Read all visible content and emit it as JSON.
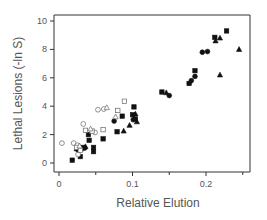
{
  "chart_data": {
    "type": "scatter",
    "title": "",
    "xlabel": "Relative Elution",
    "ylabel": "Lethal Lesions (-ln S)",
    "xlim": [
      -0.007,
      0.26
    ],
    "ylim": [
      -0.5,
      10.5
    ],
    "x_ticks": [
      0,
      0.1,
      0.2
    ],
    "x_tick_labels": [
      "0",
      "0.1",
      "0.2"
    ],
    "x_minor_ticks": [
      0.05,
      0.15,
      0.25
    ],
    "y_ticks": [
      0,
      2,
      4,
      6,
      8,
      10
    ],
    "y_tick_labels": [
      "0",
      "2",
      "4",
      "6",
      "8",
      "10"
    ],
    "grid": false,
    "legend": "none",
    "series": [
      {
        "name": "filled-square",
        "marker": "square",
        "filled": true,
        "points": [
          [
            0.018,
            0.2
          ],
          [
            0.029,
            0.45
          ],
          [
            0.03,
            1.0
          ],
          [
            0.033,
            1.1
          ],
          [
            0.04,
            2.0
          ],
          [
            0.041,
            1.6
          ],
          [
            0.047,
            1.1
          ],
          [
            0.047,
            0.8
          ],
          [
            0.06,
            1.7
          ],
          [
            0.079,
            2.2
          ],
          [
            0.086,
            3.3
          ],
          [
            0.102,
            3.95
          ],
          [
            0.1,
            3.4
          ],
          [
            0.14,
            5.0
          ],
          [
            0.177,
            5.6
          ],
          [
            0.185,
            6.5
          ],
          [
            0.212,
            8.85
          ],
          [
            0.228,
            9.3
          ],
          [
            0.104,
            3.1
          ]
        ]
      },
      {
        "name": "filled-circle",
        "marker": "circle",
        "filled": true,
        "points": [
          [
            0.026,
            0.9
          ],
          [
            0.035,
            1.05
          ],
          [
            0.075,
            2.95
          ],
          [
            0.101,
            3.05
          ],
          [
            0.15,
            4.75
          ],
          [
            0.18,
            5.8
          ],
          [
            0.185,
            6.1
          ],
          [
            0.195,
            7.8
          ],
          [
            0.202,
            7.85
          ]
        ]
      },
      {
        "name": "filled-triangle",
        "marker": "triangle",
        "filled": true,
        "points": [
          [
            0.024,
            1.0
          ],
          [
            0.036,
            1.15
          ],
          [
            0.088,
            2.25
          ],
          [
            0.096,
            2.65
          ],
          [
            0.104,
            3.45
          ],
          [
            0.106,
            2.9
          ],
          [
            0.146,
            4.95
          ],
          [
            0.213,
            8.6
          ],
          [
            0.219,
            8.8
          ],
          [
            0.219,
            6.2
          ],
          [
            0.245,
            8.0
          ]
        ]
      },
      {
        "name": "open-circle",
        "marker": "circle",
        "filled": false,
        "points": [
          [
            0.004,
            1.4
          ],
          [
            0.02,
            1.4
          ],
          [
            0.033,
            2.75
          ],
          [
            0.025,
            1.25
          ],
          [
            0.049,
            2.15
          ],
          [
            0.053,
            3.75
          ],
          [
            0.061,
            3.8
          ],
          [
            0.026,
            0.6
          ]
        ]
      },
      {
        "name": "open-square",
        "marker": "square",
        "filled": false,
        "points": [
          [
            0.024,
            1.1
          ],
          [
            0.036,
            2.3
          ],
          [
            0.06,
            2.35
          ],
          [
            0.08,
            3.7
          ],
          [
            0.089,
            4.35
          ],
          [
            0.029,
            0.9
          ],
          [
            0.045,
            2.25
          ]
        ]
      },
      {
        "name": "open-triangle",
        "marker": "triangle",
        "filled": false,
        "points": [
          [
            0.043,
            2.4
          ],
          [
            0.065,
            3.9
          ],
          [
            0.077,
            3.25
          ],
          [
            0.028,
            1.2
          ]
        ]
      }
    ]
  }
}
